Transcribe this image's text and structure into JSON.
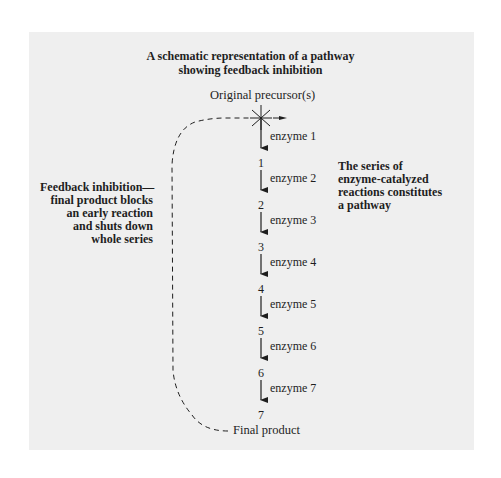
{
  "title": {
    "line1": "A schematic representation of a pathway",
    "line2": "showing feedback inhibition"
  },
  "pathway": {
    "start": "Original precursor(s)",
    "end": "Final product",
    "intermediates": [
      "1",
      "2",
      "3",
      "4",
      "5",
      "6",
      "7"
    ],
    "enzymes": [
      "enzyme 1",
      "enzyme 2",
      "enzyme 3",
      "enzyme 4",
      "enzyme 5",
      "enzyme 6",
      "enzyme 7"
    ]
  },
  "annotations": {
    "left": [
      "Feedback inhibition—",
      "final product blocks",
      "an early reaction",
      "and shuts down",
      "whole series"
    ],
    "right": [
      "The series of",
      "enzyme-catalyzed",
      "reactions constitutes",
      "a pathway"
    ]
  },
  "colors": {
    "panel": "#efefef",
    "ink": "#1e1e1e"
  }
}
